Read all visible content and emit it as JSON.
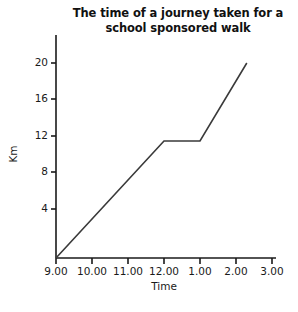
{
  "chart_data": {
    "type": "line",
    "title": "The time of a journey taken for a school sponsored walk",
    "title_lines": [
      "The time of a journey taken for a",
      "school sponsored walk"
    ],
    "xlabel": "Time",
    "ylabel": "Km",
    "grid": false,
    "legend": "none",
    "x_tick_labels": [
      "9.00",
      "10.00",
      "11.00",
      "12.00",
      "1.00",
      "2.00",
      "3.00"
    ],
    "x_tick_values": [
      9,
      10,
      11,
      12,
      13,
      14,
      15
    ],
    "y_tick_labels": [
      "4",
      "8",
      "12",
      "16",
      "20"
    ],
    "y_tick_values": [
      4,
      8,
      12,
      16,
      20
    ],
    "xlim": [
      9,
      15
    ],
    "ylim": [
      0,
      22
    ],
    "series": [
      {
        "name": "journey",
        "color": "#3a3a3a",
        "points": [
          {
            "x": 9,
            "x_label": "9.00",
            "y": 0
          },
          {
            "x": 12,
            "x_label": "12.00",
            "y": 12
          },
          {
            "x": 13,
            "x_label": "1.00",
            "y": 12
          },
          {
            "x": 14.3,
            "x_label": "2.30",
            "y": 20
          }
        ]
      }
    ],
    "axis_color": "#1a1a1a"
  }
}
